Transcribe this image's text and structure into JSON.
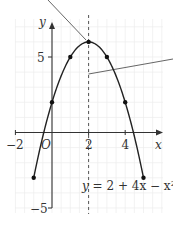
{
  "chart_data": {
    "type": "line",
    "title": "",
    "equation": "y = 2 + 4x − x²",
    "xlabel": "x",
    "ylabel": "y",
    "origin_label": "O",
    "x_ticks": [
      {
        "value": -2,
        "label": "−2"
      },
      {
        "value": 2,
        "label": "2"
      },
      {
        "value": 4,
        "label": "4"
      }
    ],
    "y_ticks": [
      {
        "value": 5,
        "label": "5"
      },
      {
        "value": -5,
        "label": "−5"
      }
    ],
    "xlim": [
      -2.1,
      6
    ],
    "ylim": [
      -5.3,
      7.5
    ],
    "grid": true,
    "series": [
      {
        "name": "y = 2 + 4x − x²",
        "x": [
          -1,
          0,
          1,
          2,
          3,
          4,
          5
        ],
        "y": [
          -3,
          2,
          5,
          6,
          5,
          2,
          -3
        ],
        "markers": true,
        "curve": "smooth"
      }
    ],
    "annotations": [
      {
        "type": "dashed-vertical-line",
        "x": 2,
        "meaning": "line of symmetry"
      },
      {
        "type": "leader-line",
        "target": [
          2,
          6
        ],
        "meaning": "points to vertex"
      },
      {
        "type": "leader-line",
        "target": [
          2,
          3.9
        ],
        "meaning": "points to axis of symmetry"
      }
    ]
  },
  "labels": {
    "x_axis": "x",
    "y_axis": "y",
    "origin": "O",
    "tick_x_neg2": "−2",
    "tick_x_2": "2",
    "tick_x_4": "4",
    "tick_y_5": "5",
    "tick_y_neg5": "−5",
    "equation_y": "y",
    "equation_rest": " = 2 + 4x − x²"
  },
  "colors": {
    "curve": "#222222",
    "axis": "#333333",
    "grid": "#ececec",
    "dashed": "#555555",
    "leader": "#555555"
  }
}
